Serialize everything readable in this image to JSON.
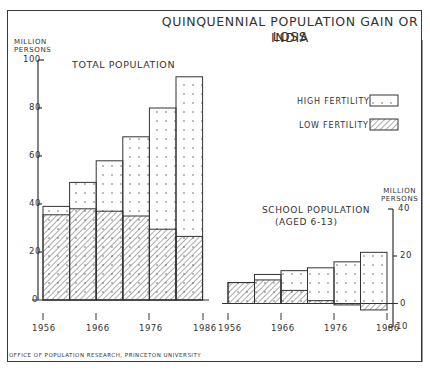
{
  "title": {
    "line1": "QUINQUENNIAL POPULATION GAIN OR LOSS",
    "line2": "INDIA"
  },
  "left_panel": {
    "label": "TOTAL POPULATION",
    "y_unit_line1": "MILLION",
    "y_unit_line2": "PERSONS",
    "y_ticks": [
      "100",
      "80",
      "60",
      "40",
      "20",
      "0"
    ],
    "x_ticks": [
      "1956",
      "1966",
      "1976",
      "1986"
    ]
  },
  "right_panel": {
    "label_line1": "SCHOOL POPULATION",
    "label_line2": "(AGED 6-13)",
    "y_unit_line1": "MILLION",
    "y_unit_line2": "PERSONS",
    "y_ticks": [
      "40",
      "20",
      "0",
      "10"
    ],
    "x_ticks": [
      "1956",
      "1966",
      "1976",
      "1986"
    ]
  },
  "legend": {
    "high": "HIGH FERTILITY",
    "low": "LOW FERTILITY"
  },
  "footer": "OFFICE OF POPULATION RESEARCH, PRINCETON UNIVERSITY",
  "chart_data": [
    {
      "type": "bar",
      "title": "QUINQUENNIAL POPULATION GAIN OR LOSS — INDIA: TOTAL POPULATION",
      "xlabel": "",
      "ylabel": "MILLION PERSONS",
      "ylim": [
        0,
        100
      ],
      "y_ticks": [
        0,
        20,
        40,
        60,
        80,
        100
      ],
      "x_tick_labels": [
        "1956",
        "1966",
        "1976",
        "1986"
      ],
      "categories": [
        "1956-61",
        "1961-66",
        "1966-71",
        "1971-76",
        "1976-81",
        "1981-86"
      ],
      "series": [
        {
          "name": "HIGH FERTILITY",
          "values": [
            39,
            49,
            58,
            68,
            80,
            93
          ]
        },
        {
          "name": "LOW FERTILITY",
          "values": [
            35.5,
            38,
            37,
            35,
            29.5,
            26.5
          ]
        }
      ],
      "grid": false,
      "legend_position": "right"
    },
    {
      "type": "bar",
      "title": "SCHOOL POPULATION (AGED 6-13)",
      "xlabel": "",
      "ylabel": "MILLION PERSONS",
      "ylim": [
        -10,
        40
      ],
      "y_ticks": [
        -10,
        0,
        20,
        40
      ],
      "x_tick_labels": [
        "1956",
        "1966",
        "1976",
        "1986"
      ],
      "categories": [
        "1956-61",
        "1961-66",
        "1966-71",
        "1971-76",
        "1976-81",
        "1981-86"
      ],
      "series": [
        {
          "name": "HIGH FERTILITY",
          "values": [
            8.8,
            12.2,
            13.8,
            15,
            17.5,
            21.5
          ]
        },
        {
          "name": "LOW FERTILITY",
          "values": [
            8.8,
            9.9,
            5.5,
            1.2,
            -0.6,
            -2.7
          ]
        }
      ],
      "grid": false,
      "legend_position": "right"
    }
  ]
}
